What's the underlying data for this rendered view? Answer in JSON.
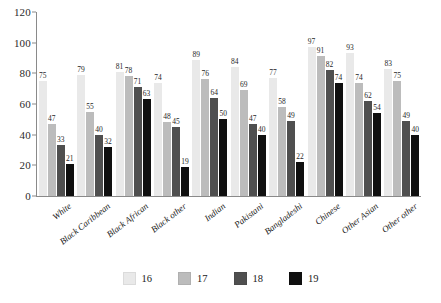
{
  "chart_data": {
    "type": "bar",
    "title": "",
    "xlabel": "",
    "ylabel": "",
    "ylim": [
      0,
      120
    ],
    "ytick_step": 20,
    "yticks": [
      0,
      20,
      40,
      60,
      80,
      100,
      120
    ],
    "grid": false,
    "legend_position": "bottom",
    "categories": [
      "White",
      "Black Caribbean",
      "Black African",
      "Black other",
      "Indian",
      "Pakistani",
      "Bangladeshi",
      "Chinese",
      "Other Asian",
      "Other other"
    ],
    "series": [
      {
        "name": "16",
        "color": "#e9e9e9",
        "values": [
          75,
          79,
          81,
          74,
          89,
          84,
          77,
          97,
          93,
          83
        ]
      },
      {
        "name": "17",
        "color": "#bcbcbc",
        "values": [
          47,
          55,
          78,
          48,
          76,
          69,
          58,
          91,
          74,
          75
        ]
      },
      {
        "name": "18",
        "color": "#4f4f4f",
        "values": [
          33,
          40,
          71,
          45,
          64,
          47,
          49,
          82,
          62,
          49
        ]
      },
      {
        "name": "19",
        "color": "#101010",
        "values": [
          21,
          32,
          63,
          19,
          50,
          40,
          22,
          74,
          54,
          40
        ]
      }
    ]
  },
  "axis": {
    "y_tick_labels": [
      "0",
      "20",
      "40",
      "60",
      "80",
      "100",
      "120"
    ],
    "axis_color": "#8a8a8a"
  },
  "legend": {
    "items": [
      {
        "label": "16",
        "color": "#e9e9e9"
      },
      {
        "label": "17",
        "color": "#bcbcbc"
      },
      {
        "label": "18",
        "color": "#4f4f4f"
      },
      {
        "label": "19",
        "color": "#101010"
      }
    ]
  }
}
